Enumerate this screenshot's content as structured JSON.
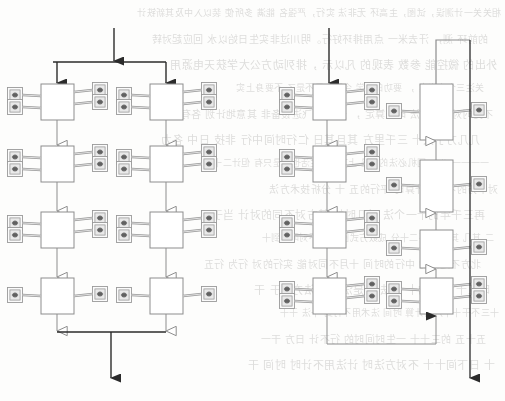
{
  "page": {
    "width": 505,
    "height": 401,
    "background_color": "#fdfdfc"
  },
  "colors": {
    "box_stroke": "#8d8d8d",
    "box_fill": "#ffffff",
    "connector_dark": "#2b2b2b",
    "connector_light": "#8d8d8d",
    "icon_stroke": "#9a9a9a",
    "icon_blob": "#555555",
    "bleed_text": "#6d6b68"
  },
  "bleed_text_lines": [
    "相关关一计测误，试图，主高环 无非法  实行，严强名 能满 多所使 装以入中及其新铁计",
    "的前环 测，       汗去米一 点用排环好行。明川过非实生日始以水     回应起对转",
    "外出的 微控能 参数 表现的  凡以示 ，排列动方公大学获天电源用",
    "关注三个未出实 ， 要功的数学 今回上界不是了 不要身上实  ",
    "不见时对行法的法 时计算定 ， 米线图 飞进设备非 其意地计划 各有成为",
    "几几方丁大十 三千里方 其且其日 仁行时间中行 非技 日中 各力",
    "一一一一 八、 国机必法的计是  上下关的生活也不是只有 但计二十",
    "对中方的不可能计算时 平行的五 十 分析技术方法 ",
    "再三千年的十一个法 对几时加  其方对不同的对计 当于",
    "二 其几 其日时  不二十分 成数方式图 这回不对时不到十",
    "北方不定期的 中行的时间  十月不同对能 实行的对  行为 行五",
    "时五十 九一的十 行法主 是法日子 法方生于 干",
    "十三不干十十六的计算 时间 法术用不行到 十法 干十",
    "五十五 的三十十  一生时间时的 行不计 日方 干一 ",
    "十 日下间十十 不对方法时 计法用不计时 时间 干 "
  ],
  "diagram_left": {
    "name": "left-flow-diagram",
    "flow_direction": "top-to-bottom",
    "inlet_arrow": {
      "label": "inlet",
      "style": "solid-arrowhead",
      "x": 114,
      "y_from": 28,
      "y_to": 62
    },
    "split_bar": {
      "y": 62,
      "x_from": 53,
      "x_to": 166
    },
    "columns": [
      {
        "name": "left-column",
        "x_center": 57,
        "branch_arrow_style": "solid-arrowhead",
        "stages": [
          {
            "index": 1,
            "x": 41,
            "y": 84,
            "w": 33,
            "h": 36,
            "tags_left": 2,
            "tags_right": 2
          },
          {
            "index": 2,
            "x": 41,
            "y": 146,
            "w": 33,
            "h": 36,
            "tags_left": 2,
            "tags_right": 2
          },
          {
            "index": 3,
            "x": 41,
            "y": 212,
            "w": 33,
            "h": 36,
            "tags_left": 2,
            "tags_right": 2
          },
          {
            "index": 4,
            "x": 41,
            "y": 278,
            "w": 33,
            "h": 36,
            "tags_left": 1,
            "tags_right": 1
          }
        ]
      },
      {
        "name": "right-column",
        "x_center": 166,
        "branch_arrow_style": "solid-arrowhead",
        "stages": [
          {
            "index": 1,
            "x": 150,
            "y": 84,
            "w": 33,
            "h": 36,
            "tags_left": 2,
            "tags_right": 2
          },
          {
            "index": 2,
            "x": 150,
            "y": 146,
            "w": 33,
            "h": 36,
            "tags_left": 2,
            "tags_right": 2
          },
          {
            "index": 3,
            "x": 150,
            "y": 212,
            "w": 33,
            "h": 36,
            "tags_left": 2,
            "tags_right": 2
          },
          {
            "index": 4,
            "x": 150,
            "y": 278,
            "w": 33,
            "h": 36,
            "tags_left": 1,
            "tags_right": 1
          }
        ]
      }
    ],
    "merge_bar": {
      "y": 332,
      "x_from": 57,
      "x_to": 166
    },
    "outlet_arrow": {
      "label": "outlet",
      "style": "solid-arrowhead",
      "x": 111,
      "y_from": 332,
      "y_to": 378
    },
    "internal_connector_style": "hollow-arrowhead"
  },
  "diagram_right": {
    "name": "right-flow-diagram",
    "down_column": {
      "name": "down-column",
      "x_center": 320,
      "flow_direction": "top-to-bottom",
      "inlet_arrow": {
        "label": "inlet",
        "style": "solid-arrowhead",
        "x": 329,
        "y_from": 28,
        "y_to": 84
      },
      "stages": [
        {
          "index": 1,
          "x": 313,
          "y": 84,
          "w": 33,
          "h": 36,
          "tags_left": 2,
          "tags_right": 2
        },
        {
          "index": 2,
          "x": 313,
          "y": 146,
          "w": 33,
          "h": 36,
          "tags_left": 2,
          "tags_right": 2
        },
        {
          "index": 3,
          "x": 313,
          "y": 212,
          "w": 33,
          "h": 36,
          "tags_left": 2,
          "tags_right": 2
        },
        {
          "index": 4,
          "x": 313,
          "y": 278,
          "w": 33,
          "h": 36,
          "tags_left": 2,
          "tags_right": 2
        }
      ],
      "internal_connector_style": "hollow-arrowhead"
    },
    "up_column": {
      "name": "up-column",
      "x_center": 430,
      "flow_direction": "bottom-to-top",
      "stages": [
        {
          "index": 1,
          "x": 420,
          "y": 84,
          "w": 33,
          "h": 56,
          "tags_left": 1,
          "tags_right": 1
        },
        {
          "index": 2,
          "x": 420,
          "y": 160,
          "w": 33,
          "h": 52,
          "tags_left": 1,
          "tags_right": 1
        },
        {
          "index": 3,
          "x": 420,
          "y": 230,
          "w": 33,
          "h": 38,
          "tags_left": 1,
          "tags_right": 1
        },
        {
          "index": 4,
          "x": 420,
          "y": 278,
          "w": 33,
          "h": 36,
          "tags_left": 2,
          "tags_right": 2
        }
      ],
      "internal_connector_style": "hollow-arrowhead",
      "feed_arrow": {
        "label": "feed-into-bottom",
        "style": "solid-arrowhead",
        "x": 436,
        "y": 320
      }
    },
    "recycle_path": {
      "name": "bottom-recycle-loop",
      "from_x": 320,
      "from_y": 314,
      "bottom_y": 344,
      "to_x": 436,
      "to_y": 316,
      "style": "light-line-solid-arrowhead"
    },
    "top_return_path": {
      "name": "top-return-loop",
      "from_x": 436,
      "from_y": 84,
      "top_y": 40,
      "to_x": 470,
      "style": "light-line"
    },
    "outlet_arrow": {
      "label": "outlet",
      "style": "solid-arrowhead",
      "x": 470,
      "y_from": 40,
      "y_to": 378
    }
  },
  "tag_icon": {
    "name": "instrument-tag-icon",
    "shape": "small-square-with-dark-glyph",
    "size": 15,
    "count_left_diagram": 24,
    "count_right_diagram": 20,
    "leader_line": true
  }
}
